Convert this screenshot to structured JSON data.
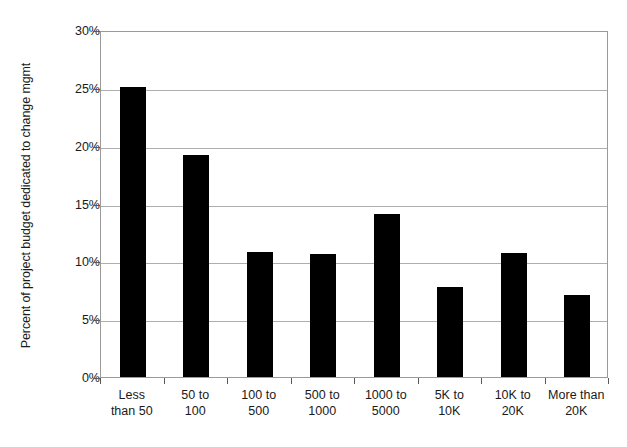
{
  "chart_data": {
    "type": "bar",
    "title": "",
    "xlabel": "",
    "ylabel": "Percent of project budget dedicated to change mgmt",
    "categories": [
      "Less\nthan 50",
      "50 to\n100",
      "100 to\n500",
      "500 to\n1000",
      "1000 to\n5000",
      "5K to\n10K",
      "10K to\n20K",
      "More than\n20K"
    ],
    "values": [
      25.1,
      19.2,
      10.8,
      10.6,
      14.1,
      7.8,
      10.7,
      7.1
    ],
    "ylim": [
      0,
      30
    ],
    "ytick_labels": [
      "30%",
      "25%",
      "20%",
      "15%",
      "10%",
      "5%",
      "0%"
    ],
    "ytick_values": [
      30,
      25,
      20,
      15,
      10,
      5,
      0
    ],
    "grid": true,
    "legend": false,
    "bar_color": "#000000",
    "grid_color": "#aeaeae",
    "axis_color": "#9a9a9a",
    "text_color": "#1a1a1a"
  }
}
